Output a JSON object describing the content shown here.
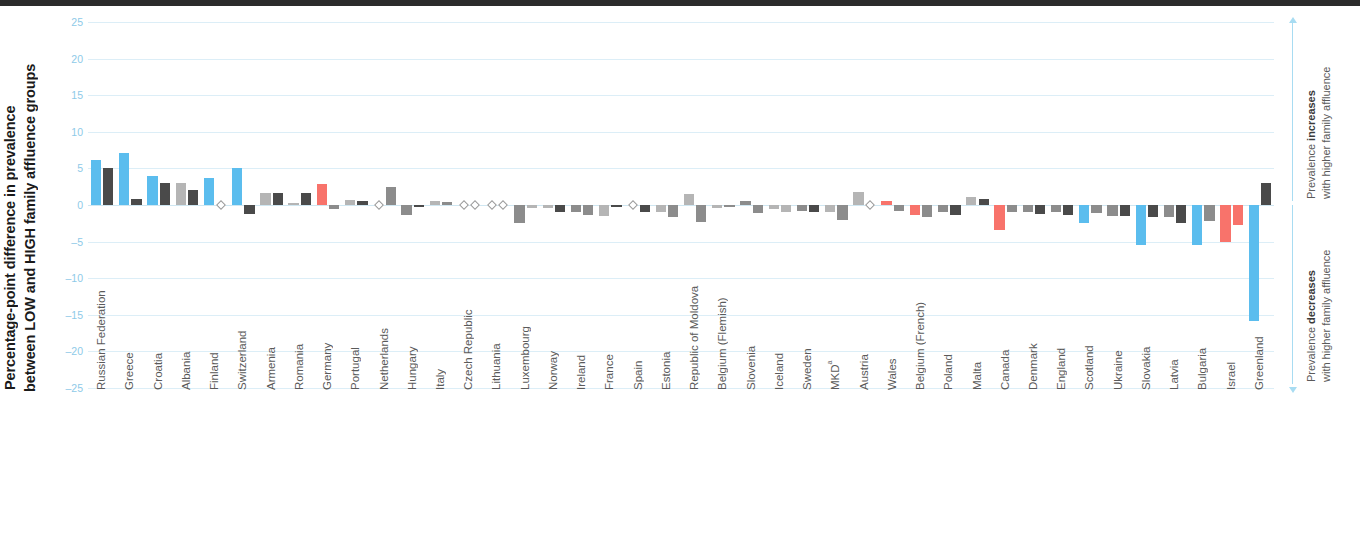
{
  "axis_title": {
    "line1": "Percentage-point difference in prevalence",
    "line2": "between LOW and HIGH family affluence groups"
  },
  "annotations": {
    "increase": {
      "prefix": "Prevalence ",
      "strong": "increases",
      "second": "with higher family affluence"
    },
    "decrease": {
      "prefix": "Prevalence ",
      "strong": "decreases",
      "second": "with higher family affluence"
    }
  },
  "colors": {
    "blue": "#5BBDEE",
    "dark_gray": "#4A4A4A",
    "mid_gray": "#8C8C8C",
    "light_gray": "#B5B5B5",
    "red": "#F8736B",
    "grid": "#DCEEF7",
    "tick_text": "#8ECAE8"
  },
  "chart_data": {
    "type": "bar",
    "title": "",
    "xlabel": "",
    "ylabel": "Percentage-point difference in prevalence between LOW and HIGH family affluence groups",
    "ylim": [
      -25,
      25
    ],
    "yticks": [
      25,
      20,
      15,
      10,
      5,
      0,
      -5,
      -10,
      -15,
      -20,
      -25
    ],
    "ytick_labels": [
      "25",
      "20",
      "15",
      "10",
      "5",
      "0",
      "–5",
      "–10",
      "–15",
      "–20",
      "–25"
    ],
    "grid": true,
    "legend": "none",
    "zero_marker": "diamond",
    "categories": [
      "Russian Federation",
      "Greece",
      "Croatia",
      "Albania",
      "Finland",
      "Switzerland",
      "Armenia",
      "Romania",
      "Germany",
      "Portugal",
      "Netherlands",
      "Hungary",
      "Italy",
      "Czech Republic",
      "Lithuania",
      "Luxembourg",
      "Norway",
      "Ireland",
      "France",
      "Spain",
      "Estonia",
      "Republic of Moldova",
      "Belgium (Flemish)",
      "Slovenia",
      "Iceland",
      "Sweden",
      "MKD",
      "Austria",
      "Wales",
      "Belgium (French)",
      "Poland",
      "Malta",
      "Canada",
      "Denmark",
      "England",
      "Scotland",
      "Ukraine",
      "Slovakia",
      "Latvia",
      "Bulgaria",
      "Israel",
      "Greenland"
    ],
    "category_superscripts": {
      "MKD": "a"
    },
    "series": [
      {
        "name": "Series 1",
        "values": [
          6.1,
          7.1,
          4.0,
          3.0,
          3.7,
          5.0,
          1.6,
          0.3,
          2.9,
          0.7,
          0.0,
          -1.3,
          0.5,
          0.0,
          0.0,
          -2.4,
          -0.4,
          -1.0,
          -1.5,
          0.0,
          -1.0,
          1.5,
          -0.4,
          0.6,
          -0.5,
          -0.8,
          -1.0,
          1.8,
          0.5,
          -1.4,
          -1.0,
          1.1,
          -3.4,
          -1.0,
          -1.0,
          -2.5,
          -1.5,
          -5.5,
          -1.7,
          -5.5,
          -5.0,
          -15.8
        ],
        "colors": [
          "blue",
          "blue",
          "blue",
          "light_gray",
          "blue",
          "blue",
          "light_gray",
          "light_gray",
          "red",
          "light_gray",
          "light_gray",
          "mid_gray",
          "light_gray",
          "none",
          "none",
          "mid_gray",
          "light_gray",
          "mid_gray",
          "light_gray",
          "none",
          "light_gray",
          "light_gray",
          "light_gray",
          "mid_gray",
          "light_gray",
          "mid_gray",
          "light_gray",
          "light_gray",
          "red",
          "red",
          "mid_gray",
          "light_gray",
          "red",
          "mid_gray",
          "mid_gray",
          "blue",
          "mid_gray",
          "blue",
          "mid_gray",
          "blue",
          "red",
          "blue"
        ]
      },
      {
        "name": "Series 2",
        "values": [
          5.0,
          0.8,
          3.0,
          2.0,
          0.0,
          -1.2,
          1.6,
          1.6,
          -0.6,
          0.5,
          2.4,
          -0.2,
          0.4,
          0.0,
          0.0,
          -0.4,
          -0.9,
          -1.3,
          -0.3,
          -1.0,
          -1.6,
          -2.3,
          -0.3,
          -1.1,
          -0.9,
          -1.0,
          -2.0,
          0.0,
          -0.8,
          -1.6,
          -1.3,
          0.8,
          -1.0,
          -1.2,
          -1.4,
          -1.1,
          -1.5,
          -1.6,
          -2.4,
          -2.2,
          -2.8,
          3.0
        ],
        "colors": [
          "dark_gray",
          "dark_gray",
          "dark_gray",
          "dark_gray",
          "none",
          "dark_gray",
          "dark_gray",
          "dark_gray",
          "mid_gray",
          "dark_gray",
          "mid_gray",
          "dark_gray",
          "mid_gray",
          "none",
          "none",
          "light_gray",
          "dark_gray",
          "mid_gray",
          "dark_gray",
          "dark_gray",
          "mid_gray",
          "mid_gray",
          "mid_gray",
          "mid_gray",
          "light_gray",
          "dark_gray",
          "mid_gray",
          "none",
          "mid_gray",
          "mid_gray",
          "dark_gray",
          "dark_gray",
          "mid_gray",
          "dark_gray",
          "dark_gray",
          "mid_gray",
          "dark_gray",
          "dark_gray",
          "dark_gray",
          "mid_gray",
          "red",
          "dark_gray"
        ]
      }
    ]
  }
}
